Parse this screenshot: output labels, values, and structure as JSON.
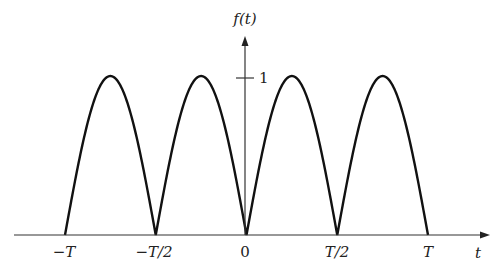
{
  "chart_data": {
    "type": "line",
    "title": "",
    "function": "f(t) = |sin(2πt/T)| (full-wave rectified sine)",
    "xlabel": "t",
    "ylabel": "f(t)",
    "x_ticks": [
      "−T",
      "−T/2",
      "0",
      "T/2",
      "T"
    ],
    "x_tick_values": [
      -1,
      -0.5,
      0,
      0.5,
      1
    ],
    "y_ticks": [
      "1"
    ],
    "y_tick_values": [
      1
    ],
    "xlim": [
      -1.0,
      1.0
    ],
    "ylim": [
      0,
      1
    ],
    "grid": false,
    "legend": null,
    "series": [
      {
        "name": "f(t)",
        "x": [
          -1.0,
          -0.875,
          -0.75,
          -0.625,
          -0.5,
          -0.375,
          -0.25,
          -0.125,
          0,
          0.125,
          0.25,
          0.375,
          0.5,
          0.625,
          0.75,
          0.875,
          1.0
        ],
        "values": [
          0,
          0.707,
          1,
          0.707,
          0,
          0.707,
          1,
          0.707,
          0,
          0.707,
          1,
          0.707,
          0,
          0.707,
          1,
          0.707,
          0
        ]
      }
    ]
  },
  "labels": {
    "y_axis": "f(t)",
    "x_axis": "t",
    "y_tick_1": "1",
    "x_ticks": [
      "−T",
      "−T/2",
      "0",
      "T/2",
      "T"
    ]
  },
  "colors": {
    "curve": "#111111",
    "axis": "#333333"
  }
}
